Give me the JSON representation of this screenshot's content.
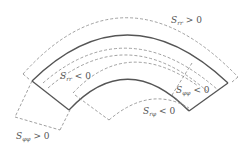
{
  "diagram": {
    "type": "curved-beam-stress-deformation",
    "labels": {
      "srr_pos": {
        "S": "S",
        "sub": "rr",
        "rel": " > 0"
      },
      "srr_neg": {
        "S": "S",
        "sub": "rr",
        "rel": " < 0"
      },
      "sphiphi_neg": {
        "S": "S",
        "sub": "φφ",
        "rel": " < 0"
      },
      "srphi_neg": {
        "S": "S",
        "sub": "rφ",
        "rel": " < 0"
      },
      "sphiphi_pos": {
        "S": "S",
        "sub": "φφ",
        "rel": " > 0"
      }
    },
    "colors": {
      "solid": "#555555",
      "dashed": "#888888",
      "text": "#555555"
    }
  }
}
